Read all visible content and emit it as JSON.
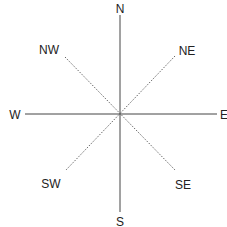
{
  "diagram": {
    "type": "compass-rose",
    "center": [
      120,
      114
    ],
    "colors": {
      "line": "#444444",
      "dotted": "#666666",
      "text": "#222222",
      "background": "#ffffff"
    },
    "labels": {
      "n": "N",
      "s": "S",
      "e": "E",
      "w": "W",
      "ne": "NE",
      "nw": "NW",
      "se": "SE",
      "sw": "SW"
    }
  }
}
